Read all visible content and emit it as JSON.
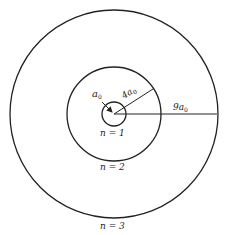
{
  "diagram": {
    "center": [
      114,
      114
    ],
    "orbits": [
      {
        "n_label": "n = 1",
        "radius_label": "a₀",
        "r_px": 12
      },
      {
        "n_label": "n = 2",
        "radius_label": "4a₀",
        "r_px": 47
      },
      {
        "n_label": "n = 3",
        "radius_label": "9a₀",
        "r_px": 104
      }
    ],
    "labels": {
      "a0": "a",
      "a0_sub": "0",
      "r2": "4a",
      "r2_sub": "0",
      "r3": "9a",
      "r3_sub": "0",
      "n1": "n = 1",
      "n2": "n = 2",
      "n3": "n = 3"
    },
    "stroke_color": "#222222"
  }
}
